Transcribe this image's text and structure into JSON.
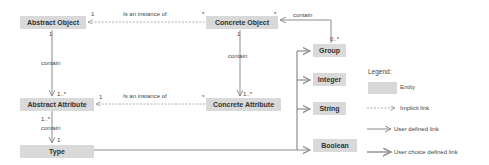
{
  "entities": {
    "abstract_object": "Abstract Object",
    "concrete_object": "Concrete Object",
    "abstract_attribute": "Abstract Attribute",
    "concrete_attribute": "Concrete Attribute",
    "type": "Type",
    "group": "Group",
    "integer": "Integer",
    "string": "String",
    "boolean": "Boolean"
  },
  "links": {
    "instance_top": "Is an instance of",
    "instance_bottom": "Is an instance of",
    "contain_left_top": "contain",
    "contain_right": "contain",
    "contain_group": "contain",
    "contain_left_bottom": "contain"
  },
  "multiplicities": {
    "ao_instance": "1",
    "co_instance": "*",
    "co_group": "*",
    "group_co": "0..*",
    "ao_down": "1",
    "aa_up": "1..*",
    "co_down": "1",
    "ca_up": "1..*",
    "aa_instance": "1",
    "ca_instance": "*",
    "aa_down": "1..*",
    "type_up": "1"
  },
  "legend": {
    "title": "Legend:",
    "entity": "Entity",
    "implicit": "Implicit link",
    "user_defined": "User defined link",
    "user_choice": "User choice defined link"
  },
  "colors": {
    "entity_fill": "#d9d9d9",
    "line": "#8c8c8c"
  }
}
